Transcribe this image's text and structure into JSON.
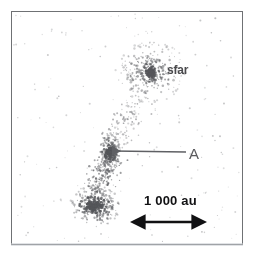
{
  "figure": {
    "title": "",
    "frame": {
      "x": 11,
      "y": 11,
      "width": 232,
      "height": 234,
      "border_color": "#6f7174"
    },
    "background_color": "#ffffff",
    "particle_color": "#55565a",
    "annotation_color": "#4a4a4d"
  },
  "labels": {
    "star_label": "sfar",
    "clump_label": "A",
    "scalebar_label": "1 000 au"
  },
  "scalebar": {
    "value": 1000,
    "unit": "au",
    "text": "1 000 au",
    "x1": 140,
    "x2": 197,
    "y": 222
  },
  "pointer_arrow": {
    "label": "A",
    "tail_x": 186,
    "tail_y": 152,
    "head_x": 109,
    "head_y": 151
  },
  "chart_data": {
    "type": "scatter",
    "title": "",
    "xlabel": "",
    "ylabel": "",
    "xlim": [
      11,
      243
    ],
    "ylim": [
      11,
      245
    ],
    "grid": false,
    "legend": "none",
    "annotations": [
      {
        "text": "sfar",
        "x": 167,
        "y": 71,
        "target_x": 155,
        "target_y": 72
      },
      {
        "text": "A",
        "x": 192,
        "y": 155,
        "target_x": 109,
        "target_y": 151
      },
      {
        "text": "1 000 au",
        "x": 168,
        "y": 201
      }
    ],
    "structures": [
      {
        "name": "primary-star-cluster",
        "center": [
          151,
          72
        ],
        "core_radius": 4,
        "halo_radius": 34,
        "n_points": 430,
        "description": "dense central star with surrounding scattered particle halo"
      },
      {
        "name": "connecting-stream",
        "path": [
          [
            140,
            100
          ],
          [
            128,
            118
          ],
          [
            118,
            134
          ],
          [
            112,
            146
          ]
        ],
        "n_points": 130,
        "description": "diffuse tidal stream linking the cluster to the filament"
      },
      {
        "name": "clump-A",
        "center": [
          110,
          152
        ],
        "core_radius": 5,
        "halo_radius": 14,
        "n_points": 200,
        "description": "compact fragment indicated by arrow labelled A"
      },
      {
        "name": "filament",
        "path": [
          [
            110,
            156
          ],
          [
            104,
            170
          ],
          [
            100,
            184
          ],
          [
            96,
            196
          ]
        ],
        "n_points": 230,
        "description": "elongated filamentary bridge of particles"
      },
      {
        "name": "lower-clump",
        "center": [
          95,
          206
        ],
        "core_radius": 6,
        "halo_radius": 22,
        "n_points": 320,
        "description": "second dense fragment at the end of the filament"
      },
      {
        "name": "field-particles",
        "center": [
          127,
          128
        ],
        "halo_radius": 110,
        "n_points": 170,
        "description": "sparse faint background field particles"
      }
    ]
  }
}
